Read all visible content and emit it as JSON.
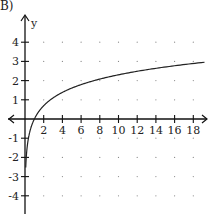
{
  "problem_label": "B)",
  "chart_data": {
    "type": "line",
    "title": "",
    "xlabel": "x",
    "ylabel": "y",
    "function": "y = ln(x)",
    "xlim": [
      -2,
      19.5
    ],
    "ylim": [
      -5,
      5
    ],
    "x_ticks": [
      2,
      4,
      6,
      8,
      10,
      12,
      14,
      16,
      18
    ],
    "y_ticks": [
      -4,
      -3,
      -2,
      -1,
      1,
      2,
      3,
      4
    ],
    "grid": "dots",
    "series": [
      {
        "name": "curve",
        "x": [
          0.1,
          0.2,
          0.3,
          0.5,
          0.75,
          1,
          1.5,
          2,
          3,
          4,
          6,
          8,
          10,
          12,
          14,
          16,
          18,
          19
        ],
        "values": [
          -2.3,
          -1.61,
          -1.2,
          -0.69,
          -0.29,
          0,
          0.41,
          0.69,
          1.1,
          1.39,
          1.79,
          2.08,
          2.3,
          2.48,
          2.64,
          2.77,
          2.89,
          2.94
        ]
      }
    ]
  }
}
